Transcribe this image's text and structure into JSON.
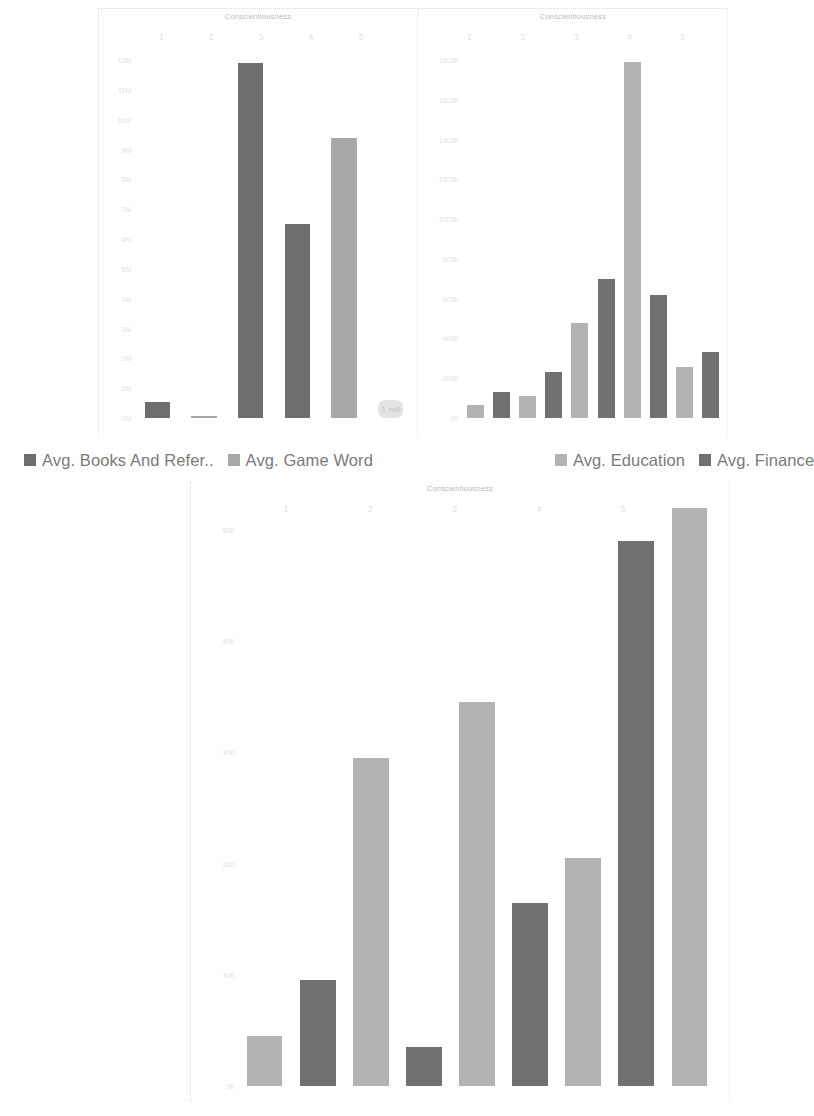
{
  "page": {
    "background": "#ffffff",
    "muted_text_color": "#dfdfdf",
    "legend_text_color": "#7a7a7a"
  },
  "series_colors": {
    "books_and_reference": "#6e6e6e",
    "game_word": "#a9a9a9",
    "education": "#b3b3b3",
    "finance": "#717171"
  },
  "legend": {
    "items": [
      {
        "label": "Avg. Books And Refer..",
        "color": "#6e6e6e",
        "name": "legend-books-and-reference"
      },
      {
        "label": "Avg. Game Word",
        "color": "#a9a9a9",
        "name": "legend-game-word"
      },
      {
        "label": "Avg. Education",
        "color": "#b3b3b3",
        "name": "legend-education"
      },
      {
        "label": "Avg. Finance",
        "color": "#717171",
        "name": "legend-finance"
      }
    ]
  },
  "chart_data": [
    {
      "id": "chart-top-left",
      "type": "bar",
      "title": "Conscientiousness",
      "xlabel": "",
      "ylabel": "",
      "grid": false,
      "legend_position": "bottom",
      "categories": [
        "1",
        "2",
        "3",
        "4",
        "5"
      ],
      "ytick_labels": [
        "12M",
        "11M",
        "10M",
        "9M",
        "8M",
        "7M",
        "6M",
        "5M",
        "4M",
        "3M",
        "2M",
        "1M",
        "0M"
      ],
      "ytick_values": [
        12,
        11,
        10,
        9,
        8,
        7,
        6,
        5,
        4,
        3,
        2,
        1,
        0
      ],
      "ylim": [
        0,
        12
      ],
      "yunit": "M",
      "series": [
        {
          "name": "Avg. Books And Refer..",
          "color": "#6e6e6e",
          "values": [
            0.55,
            11.9,
            6.5,
            null,
            null
          ]
        },
        {
          "name": "Avg. Game Word",
          "color": "#a9a9a9",
          "values": [
            null,
            0.06,
            null,
            9.4,
            null
          ]
        }
      ],
      "bars": [
        {
          "category": "1",
          "series": "Avg. Books And Refer..",
          "value": 0.55,
          "color": "#6e6e6e"
        },
        {
          "category": "2",
          "series": "Avg. Game Word",
          "value": 0.06,
          "color": "#a9a9a9"
        },
        {
          "category": "2",
          "series": "Avg. Books And Refer..",
          "value": 11.9,
          "color": "#6e6e6e"
        },
        {
          "category": "3",
          "series": "Avg. Books And Refer..",
          "value": 6.5,
          "color": "#6e6e6e"
        },
        {
          "category": "4",
          "series": "Avg. Game Word",
          "value": 9.4,
          "color": "#a9a9a9"
        },
        {
          "category": "5",
          "series": "data-label",
          "value": 0.4,
          "color": "#e3e3e3"
        }
      ],
      "annotation": {
        "text": "1 mil",
        "visible": true
      }
    },
    {
      "id": "chart-top-right",
      "type": "bar",
      "title": "Conscientiousness",
      "xlabel": "",
      "ylabel": "",
      "grid": false,
      "legend_position": "bottom",
      "categories": [
        "1",
        "2",
        "3",
        "4",
        "5"
      ],
      "ytick_labels": [
        "1800K",
        "1600K",
        "1400K",
        "1200K",
        "1000K",
        "800K",
        "600K",
        "400K",
        "200K",
        "0K"
      ],
      "ytick_values": [
        1800,
        1600,
        1400,
        1200,
        1000,
        800,
        600,
        400,
        200,
        0
      ],
      "ylim": [
        0,
        1800
      ],
      "yunit": "K",
      "series": [
        {
          "name": "Avg. Education",
          "color": "#b3b3b3",
          "values": [
            65,
            110,
            480,
            1790,
            255
          ]
        },
        {
          "name": "Avg. Finance",
          "color": "#717171",
          "values": [
            130,
            230,
            700,
            620,
            330
          ]
        }
      ],
      "bars": [
        {
          "category": "1",
          "series": "Avg. Education",
          "value": 65,
          "color": "#b3b3b3"
        },
        {
          "category": "1",
          "series": "Avg. Finance",
          "value": 130,
          "color": "#717171"
        },
        {
          "category": "2",
          "series": "Avg. Education",
          "value": 110,
          "color": "#b3b3b3"
        },
        {
          "category": "2",
          "series": "Avg. Finance",
          "value": 230,
          "color": "#717171"
        },
        {
          "category": "3",
          "series": "Avg. Education",
          "value": 480,
          "color": "#b3b3b3"
        },
        {
          "category": "3",
          "series": "Avg. Finance",
          "value": 700,
          "color": "#717171"
        },
        {
          "category": "4",
          "series": "Avg. Education",
          "value": 1790,
          "color": "#b3b3b3"
        },
        {
          "category": "4",
          "series": "Avg. Finance",
          "value": 620,
          "color": "#717171"
        },
        {
          "category": "5",
          "series": "Avg. Education",
          "value": 255,
          "color": "#b3b3b3"
        },
        {
          "category": "5",
          "series": "Avg. Finance",
          "value": 330,
          "color": "#717171"
        }
      ]
    },
    {
      "id": "chart-bottom",
      "type": "bar",
      "title": "Conscientiousness",
      "xlabel": "",
      "ylabel": "",
      "grid": false,
      "legend_position": "top",
      "categories": [
        "1",
        "2",
        "3",
        "4",
        "5"
      ],
      "ytick_labels": [
        "50K",
        "40K",
        "30K",
        "20K",
        "10K",
        "0K"
      ],
      "ytick_values": [
        50,
        40,
        30,
        20,
        10,
        0
      ],
      "ylim": [
        0,
        50
      ],
      "yunit": "K",
      "series": [
        {
          "name": "Avg. Education",
          "color": "#b3b3b3",
          "values": [
            4.5,
            29.5,
            34.5,
            45,
            52
          ]
        },
        {
          "name": "Avg. Finance",
          "color": "#717171",
          "values": [
            9.5,
            3.5,
            16.5,
            49,
            null
          ]
        }
      ],
      "bars": [
        {
          "category": "1",
          "series": "Avg. Education",
          "value": 4.5,
          "color": "#b3b3b3"
        },
        {
          "category": "1",
          "series": "Avg. Finance",
          "value": 9.5,
          "color": "#717171"
        },
        {
          "category": "2",
          "series": "Avg. Education",
          "value": 29.5,
          "color": "#b3b3b3"
        },
        {
          "category": "2",
          "series": "Avg. Finance",
          "value": 3.5,
          "color": "#717171"
        },
        {
          "category": "3",
          "series": "Avg. Education",
          "value": 34.5,
          "color": "#b3b3b3"
        },
        {
          "category": "3",
          "series": "Avg. Finance",
          "value": 16.5,
          "color": "#717171"
        },
        {
          "category": "4",
          "series": "Avg. Education",
          "value": 20.5,
          "color": "#b3b3b3"
        },
        {
          "category": "4",
          "series": "Avg. Finance",
          "value": 49,
          "color": "#717171"
        },
        {
          "category": "5",
          "series": "Avg. Education",
          "value": 52,
          "color": "#b3b3b3"
        }
      ]
    }
  ]
}
